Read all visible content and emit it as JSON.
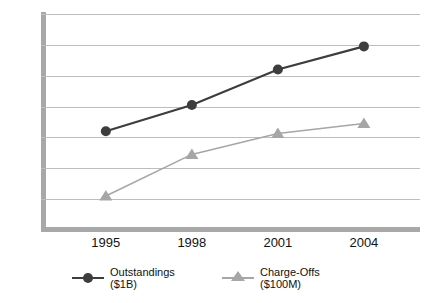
{
  "chart_data": {
    "type": "line",
    "title": "",
    "subtitle": "",
    "xlabel": "",
    "ylabel": "",
    "categories": [
      "1995",
      "1998",
      "2001",
      "2004"
    ],
    "series": [
      {
        "name": "Outstandings ($1B)",
        "label_line1": "Outstandings",
        "label_line2": "($1B)",
        "marker": "circle",
        "color": "#3d3d3d",
        "values": [
          320,
          405,
          520,
          595
        ]
      },
      {
        "name": "Charge-Offs ($100M)",
        "label_line1": "Charge-Offs",
        "label_line2": "($100M)",
        "marker": "triangle",
        "color": "#a6a6a6",
        "values": [
          110,
          245,
          313,
          345
        ]
      }
    ],
    "ylim": [
      0,
      700
    ],
    "ytick_step": 100,
    "yticks": [
      "0",
      "100",
      "200",
      "300",
      "400",
      "500",
      "600",
      "700"
    ],
    "grid": true,
    "legend_position": "bottom"
  },
  "colors": {
    "axis": "#a8a8a8",
    "gridline": "#bdbdbd",
    "series_outstandings": "#3d3d3d",
    "series_chargeoffs": "#a6a6a6",
    "background": "#ffffff",
    "text": "#111111"
  }
}
